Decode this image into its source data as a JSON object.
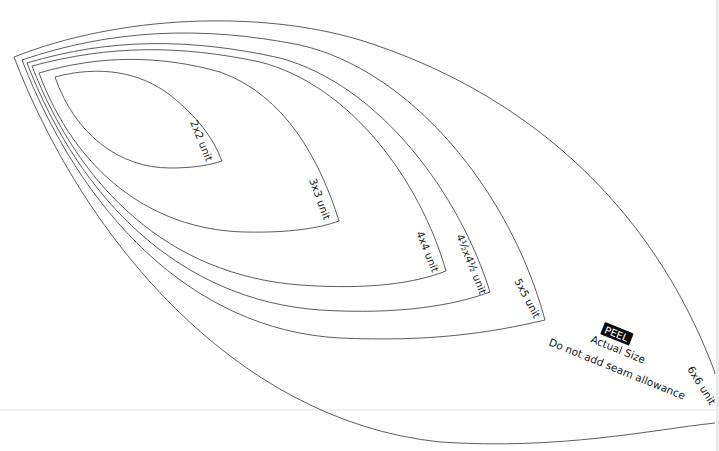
{
  "template": {
    "title": "Leaf / melon template set",
    "stroke_color": "#4a4a4a",
    "background": "#ffffff",
    "shapes": [
      {
        "id": "unit-2x2",
        "label": "2x2 unit"
      },
      {
        "id": "unit-3x3",
        "label": "3x3 unit"
      },
      {
        "id": "unit-4x4",
        "label": "4x4 unit"
      },
      {
        "id": "unit-4half",
        "label": "4½x4½ unit"
      },
      {
        "id": "unit-5x5",
        "label": "5x5 unit"
      },
      {
        "id": "unit-6x6",
        "label": "6x6 unit"
      }
    ]
  },
  "notes": {
    "peel": "PEEL",
    "actual_size": "Actual Size",
    "seam": "Do not add seam allowance"
  }
}
